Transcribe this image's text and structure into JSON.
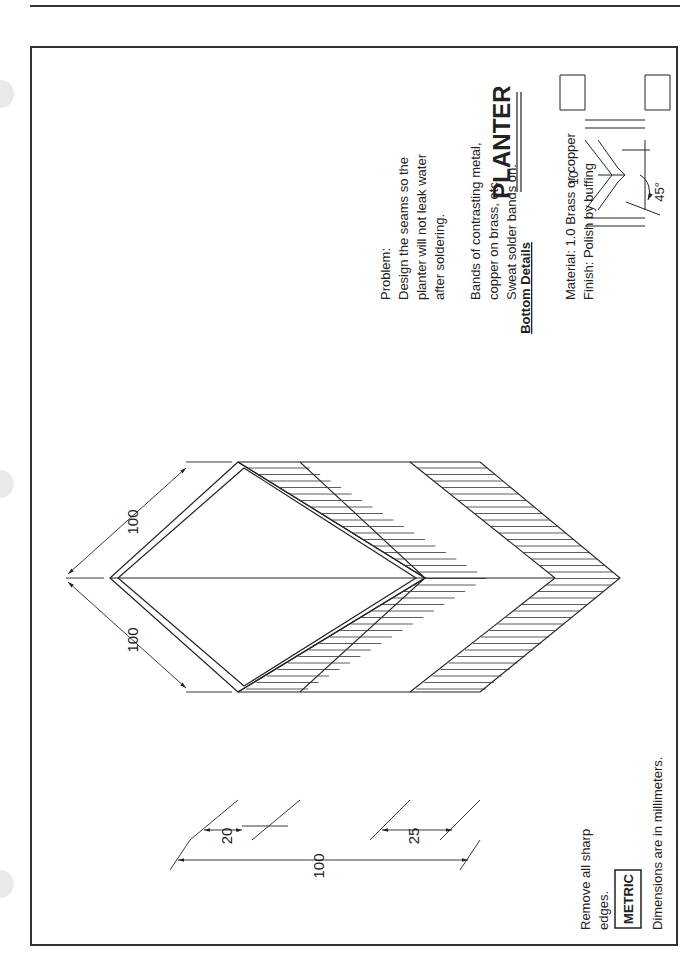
{
  "drawing": {
    "title": "PLANTER",
    "bottom_details_label": "Bottom Details",
    "bottom_details": {
      "dimension": "10",
      "angle": "45°"
    },
    "notes": {
      "problem": [
        "Problem:",
        "Design the seams so the",
        "planter will not leak water",
        "after soldering."
      ],
      "bands": [
        "Bands of contrasting metal,",
        "copper on brass, etc.",
        "Sweat solder bands on."
      ],
      "material": [
        "Material: 1.0 Brass or copper",
        "Finish: Polish by buffing"
      ],
      "edges": [
        "Remove all sharp",
        "edges."
      ],
      "metric_label": "METRIC",
      "units": "Dimensions are in millimeters."
    },
    "dimensions": {
      "side_a": "100",
      "side_b": "100",
      "top_band": "20",
      "bottom_band": "25",
      "height": "100"
    }
  }
}
